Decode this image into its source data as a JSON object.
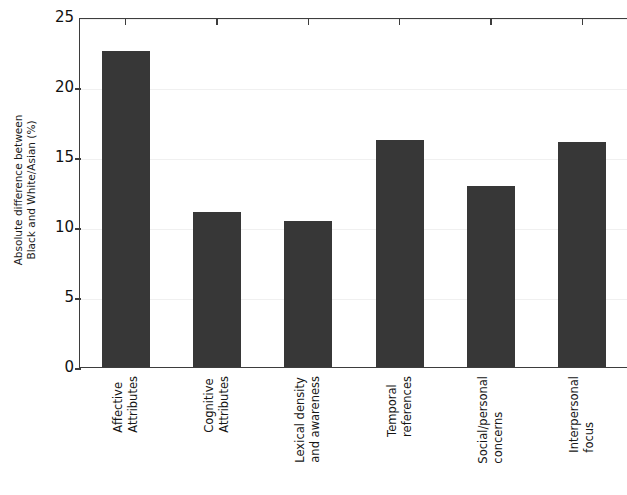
{
  "chart_data": {
    "type": "bar",
    "title": "",
    "subtitle": "",
    "xlabel": "",
    "ylabel": "Absolute difference between Black and White/Asian (%)",
    "ylabel_lines": [
      "Absolute difference between",
      "Black and White/Asian (%)"
    ],
    "categories": [
      "Affective Attributes",
      "Cognitive Attributes",
      "Lexical density and awareness",
      "Temporal references",
      "Social/personal concerns",
      "Interpersonal focus"
    ],
    "category_lines": [
      [
        "Affective",
        "Attributes"
      ],
      [
        "Cognitive",
        "Attributes"
      ],
      [
        "Lexical density",
        "and awareness"
      ],
      [
        "Temporal",
        "references"
      ],
      [
        "Social/personal",
        "concerns"
      ],
      [
        "Interpersonal",
        "focus"
      ]
    ],
    "values": [
      22.6,
      11.1,
      10.4,
      16.2,
      12.9,
      16.1
    ],
    "ylim": [
      0,
      25
    ],
    "yticks": [
      0,
      5,
      10,
      15,
      20,
      25
    ],
    "ytick_labels": [
      "0",
      "5",
      "10",
      "15",
      "20",
      "25"
    ],
    "grid": true,
    "grid_axis": "y",
    "legend": "none",
    "bar_color": "#373737",
    "grid_color": "#f0f0f0",
    "axis_color": "#3d3d3d",
    "background_color": "#ffffff"
  }
}
